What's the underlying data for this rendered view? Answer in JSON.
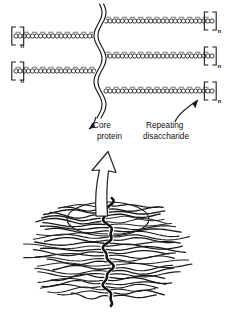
{
  "figure": {
    "colors": {
      "stroke": "#1a1a1a",
      "background": "#ffffff",
      "sugar_fill": "#ffffff",
      "backbone": "#111111"
    }
  },
  "labels": {
    "core_protein": {
      "line1": "Core",
      "line2": "protein"
    },
    "repeating_disaccharide": {
      "line1": "Repeating",
      "line2": "disaccharide"
    },
    "repeat_subscript": "n"
  },
  "core_protein": {
    "name": "core-protein-strand",
    "style": "wavy-double-line",
    "orientation": "vertical",
    "x": 100,
    "y_top": 4,
    "y_bottom": 118
  },
  "gag_chains": [
    {
      "id": "left-chain-1",
      "side": "left",
      "y": 36,
      "x_start": 14,
      "x_end": 96,
      "sugar_count": 20,
      "bracket_side": "left",
      "subscript": "n"
    },
    {
      "id": "left-chain-2",
      "side": "left",
      "y": 71,
      "x_start": 14,
      "x_end": 96,
      "sugar_count": 20,
      "bracket_side": "left",
      "subscript": "n"
    },
    {
      "id": "right-chain-1",
      "side": "right",
      "y": 21,
      "x_start": 104,
      "x_end": 214,
      "sugar_count": 27,
      "bracket_side": "right",
      "subscript": "n"
    },
    {
      "id": "right-chain-2",
      "side": "right",
      "y": 56,
      "x_start": 104,
      "x_end": 214,
      "sugar_count": 27,
      "bracket_side": "right",
      "subscript": "n"
    },
    {
      "id": "right-chain-3",
      "side": "right",
      "y": 91,
      "x_start": 104,
      "x_end": 214,
      "sugar_count": 27,
      "bracket_side": "right",
      "subscript": "n"
    }
  ],
  "magnifier_arrow": {
    "name": "magnification-arrow",
    "style": "hollow-outline-up-arrow",
    "tip_y": 152,
    "base_y": 216
  },
  "aggregate": {
    "name": "proteoglycan-aggregate",
    "backbone": {
      "style": "thick-wavy-vertical",
      "y_top": 198,
      "y_bottom": 306
    },
    "bristle_count": 30,
    "highlight_ellipse": {
      "cx": 108,
      "cy": 219,
      "rx": 41,
      "ry": 17
    }
  }
}
